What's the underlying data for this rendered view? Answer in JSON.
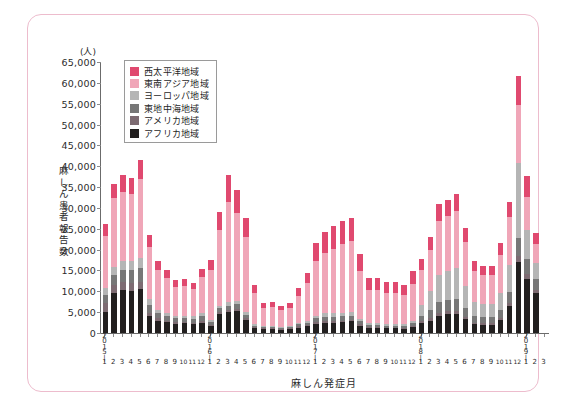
{
  "chart_data": {
    "type": "bar",
    "title": "",
    "subtitle": "",
    "stacked": true,
    "xlabel": "麻しん発症月",
    "ylabel": "麻しん患者報告数",
    "yunit": "(人)",
    "ylim": [
      0,
      65000
    ],
    "ytick_step": 5000,
    "yticks": [
      "0",
      "5,000",
      "10,000",
      "15,000",
      "20,000",
      "25,000",
      "30,000",
      "35,000",
      "40,000",
      "45,000",
      "50,000",
      "55,000",
      "60,000",
      "65,000"
    ],
    "grid": false,
    "legend_position": "top-left",
    "legend": [
      "西太平洋地域",
      "東南アジア地域",
      "ヨーロッパ地域",
      "東地中海地域",
      "アメリカ地域",
      "アフリカ地域"
    ],
    "colors": {
      "西太平洋地域": "#e0496f",
      "東南アジア地域": "#f0a6b8",
      "ヨーロッパ地域": "#b5b5b5",
      "東地中海地域": "#777777",
      "アメリカ地域": "#7d6b72",
      "アフリカ地域": "#221f1f"
    },
    "years": [
      {
        "year": "2015",
        "months": [
          "1",
          "2",
          "3",
          "4",
          "5",
          "6",
          "7",
          "8",
          "9",
          "10",
          "11",
          "12"
        ]
      },
      {
        "year": "2016",
        "months": [
          "1",
          "2",
          "3",
          "4",
          "5",
          "6",
          "7",
          "8",
          "9",
          "10",
          "11",
          "12"
        ]
      },
      {
        "year": "2017",
        "months": [
          "1",
          "2",
          "3",
          "4",
          "5",
          "6",
          "7",
          "8",
          "9",
          "10",
          "11",
          "12"
        ]
      },
      {
        "year": "2018",
        "months": [
          "1",
          "2",
          "3",
          "4",
          "5",
          "6",
          "7",
          "8",
          "9",
          "10",
          "11",
          "12"
        ]
      },
      {
        "year": "2019",
        "months": [
          "1",
          "2",
          "3"
        ]
      }
    ],
    "categories": [
      "2015-1",
      "2015-2",
      "2015-3",
      "2015-4",
      "2015-5",
      "2015-6",
      "2015-7",
      "2015-8",
      "2015-9",
      "2015-10",
      "2015-11",
      "2015-12",
      "2016-1",
      "2016-2",
      "2016-3",
      "2016-4",
      "2016-5",
      "2016-6",
      "2016-7",
      "2016-8",
      "2016-9",
      "2016-10",
      "2016-11",
      "2016-12",
      "2017-1",
      "2017-2",
      "2017-3",
      "2017-4",
      "2017-5",
      "2017-6",
      "2017-7",
      "2017-8",
      "2017-9",
      "2017-10",
      "2017-11",
      "2017-12",
      "2018-1",
      "2018-2",
      "2018-3",
      "2018-4",
      "2018-5",
      "2018-6",
      "2018-7",
      "2018-8",
      "2018-9",
      "2018-10",
      "2018-11",
      "2018-12",
      "2019-1",
      "2019-2",
      "2019-3"
    ],
    "series": [
      {
        "name": "アフリカ地域",
        "values": [
          5000,
          9500,
          10200,
          10000,
          10500,
          4000,
          3000,
          2600,
          2200,
          2300,
          2100,
          2500,
          1600,
          4500,
          5000,
          5200,
          3200,
          1200,
          900,
          1000,
          800,
          900,
          1300,
          1600,
          2200,
          2500,
          2500,
          2600,
          2800,
          1800,
          1200,
          1200,
          1100,
          1100,
          1000,
          1400,
          2400,
          3000,
          4200,
          4500,
          4600,
          3400,
          2100,
          2000,
          2000,
          3200,
          6500,
          17000,
          13000,
          9500,
          0
        ]
      },
      {
        "name": "アメリカ地域",
        "values": [
          2200,
          2000,
          2000,
          2000,
          1800,
          900,
          500,
          400,
          400,
          400,
          400,
          500,
          300,
          500,
          600,
          600,
          400,
          200,
          200,
          200,
          200,
          200,
          300,
          300,
          400,
          400,
          400,
          400,
          400,
          300,
          200,
          200,
          200,
          200,
          200,
          300,
          400,
          500,
          600,
          700,
          700,
          500,
          400,
          400,
          400,
          500,
          800,
          1500,
          1200,
          900,
          0
        ]
      },
      {
        "name": "東地中海地域",
        "values": [
          2000,
          2500,
          2900,
          3000,
          3200,
          1800,
          1200,
          1000,
          900,
          900,
          900,
          1100,
          700,
          900,
          1000,
          1100,
          800,
          400,
          300,
          300,
          300,
          300,
          500,
          600,
          900,
          1000,
          1000,
          1000,
          1000,
          700,
          500,
          500,
          500,
          500,
          500,
          600,
          1400,
          2000,
          2600,
          2800,
          2900,
          2000,
          1500,
          1400,
          1400,
          1800,
          2600,
          4200,
          3500,
          2500,
          0
        ]
      },
      {
        "name": "ヨーロッパ地域",
        "values": [
          1500,
          1800,
          2200,
          2300,
          2400,
          1400,
          900,
          700,
          600,
          600,
          600,
          800,
          500,
          700,
          800,
          900,
          600,
          300,
          200,
          200,
          200,
          200,
          400,
          500,
          700,
          800,
          800,
          800,
          800,
          600,
          400,
          400,
          400,
          400,
          400,
          500,
          2500,
          4500,
          6500,
          7000,
          7500,
          5500,
          3500,
          3200,
          3200,
          4200,
          6500,
          18000,
          7000,
          4000,
          0
        ]
      },
      {
        "name": "東南アジア地域",
        "values": [
          12500,
          16500,
          16500,
          16000,
          19000,
          12500,
          9500,
          8500,
          7000,
          7000,
          6500,
          8500,
          12000,
          18000,
          24000,
          21000,
          18000,
          7500,
          4500,
          4500,
          4000,
          4500,
          6500,
          9000,
          13000,
          14500,
          15500,
          16500,
          17000,
          11500,
          8000,
          8000,
          7500,
          7500,
          7000,
          9000,
          8500,
          10000,
          13000,
          13000,
          13500,
          10500,
          7500,
          7000,
          7000,
          9000,
          11500,
          14000,
          8000,
          4500,
          0
        ]
      },
      {
        "name": "西太平洋地域",
        "values": [
          3000,
          3500,
          4000,
          4000,
          4500,
          3000,
          2200,
          2000,
          1700,
          1700,
          1600,
          2000,
          2500,
          4500,
          6500,
          5500,
          4500,
          2000,
          1200,
          1200,
          1100,
          1200,
          1800,
          2500,
          4500,
          5000,
          5500,
          5500,
          5500,
          4000,
          2800,
          2800,
          2600,
          2600,
          2500,
          3000,
          2500,
          3000,
          4000,
          4000,
          4200,
          3200,
          2300,
          2200,
          2200,
          2800,
          3600,
          7000,
          5000,
          2600,
          0
        ]
      }
    ]
  }
}
